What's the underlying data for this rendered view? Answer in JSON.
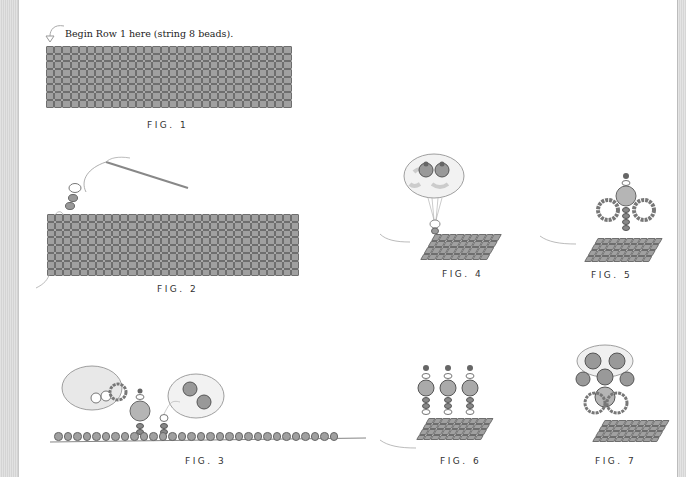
{
  "page": {
    "instruction": "Begin Row 1 here (string 8 beads).",
    "colors": {
      "bead_fill": "#a0a0a0",
      "bead_stroke": "#6e6e6e",
      "background": "#ffffff"
    }
  },
  "figures": [
    {
      "id": "fig1",
      "caption": "FIG. 1",
      "description": "Flat bead grid 30 columns by 8 rows"
    },
    {
      "id": "fig2",
      "caption": "FIG. 2",
      "description": "Bead grid with needle and thread adding beads"
    },
    {
      "id": "fig3",
      "caption": "FIG. 3",
      "description": "Bead strand with fringe loops, dangles and enlarged detail bubbles"
    },
    {
      "id": "fig4",
      "caption": "FIG. 4",
      "description": "Small grid with single dangle and enlarged detail bubble"
    },
    {
      "id": "fig5",
      "caption": "FIG. 5",
      "description": "Small grid with center dangle and two side loops"
    },
    {
      "id": "fig6",
      "caption": "FIG. 6",
      "description": "Small grid with three dangles"
    },
    {
      "id": "fig7",
      "caption": "FIG. 7",
      "description": "Small grid with clustered dangles and loops"
    }
  ]
}
